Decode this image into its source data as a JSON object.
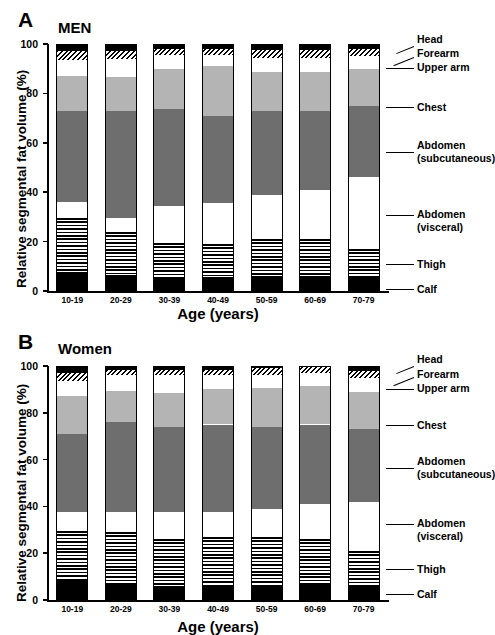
{
  "figure": {
    "panels": [
      {
        "letter": "A",
        "title": "MEN",
        "yaxis_label": "Relative segmental fat volume (%)",
        "xaxis_label": "Age (years)",
        "yticks": [
          0,
          20,
          40,
          60,
          80,
          100
        ],
        "categories": [
          "10-19",
          "20-29",
          "30-39",
          "40-49",
          "50-59",
          "60-69",
          "70-79"
        ]
      },
      {
        "letter": "B",
        "title": "Women",
        "yaxis_label": "Relative segmental fat volume (%)",
        "xaxis_label": "Age (years)",
        "yticks": [
          0,
          20,
          40,
          60,
          80,
          100
        ],
        "categories": [
          "10-19",
          "20-29",
          "30-39",
          "40-49",
          "50-59",
          "60-69",
          "70-79"
        ]
      }
    ],
    "legend": [
      {
        "key": "head",
        "label": "Head"
      },
      {
        "key": "forearm",
        "label": "Forearm"
      },
      {
        "key": "upper_arm",
        "label": "Upper arm"
      },
      {
        "key": "chest",
        "label": "Chest"
      },
      {
        "key": "abd_sub",
        "label": "Abdomen"
      },
      {
        "key": "abd_sub2",
        "label": "(subcutaneous)"
      },
      {
        "key": "abd_vis",
        "label": "Abdomen"
      },
      {
        "key": "abd_vis2",
        "label": "(visceral)"
      },
      {
        "key": "thigh",
        "label": "Thigh"
      },
      {
        "key": "calf",
        "label": "Calf"
      }
    ]
  },
  "chart_data": [
    {
      "type": "bar",
      "stacked": true,
      "title": "MEN",
      "panel": "A",
      "xlabel": "Age (years)",
      "ylabel": "Relative segmental fat volume (%)",
      "ylim": [
        0,
        100
      ],
      "yticks": [
        0,
        20,
        40,
        60,
        80,
        100
      ],
      "grid": false,
      "legend_position": "right",
      "categories": [
        "10-19",
        "20-29",
        "30-39",
        "40-49",
        "50-59",
        "60-69",
        "70-79"
      ],
      "series": [
        {
          "name": "Calf",
          "fill": "black",
          "values": [
            7.0,
            6.5,
            5.0,
            5.5,
            5.5,
            5.5,
            6.0
          ]
        },
        {
          "name": "Thigh",
          "fill": "horizontal-stripe",
          "values": [
            22.5,
            17.5,
            14.5,
            13.5,
            15.5,
            15.5,
            11.0
          ]
        },
        {
          "name": "Abdomen (visceral)",
          "fill": "white",
          "values": [
            6.5,
            5.5,
            15.0,
            16.5,
            18.0,
            20.0,
            29.0
          ]
        },
        {
          "name": "Abdomen (subcutaneous)",
          "fill": "dark-gray",
          "values": [
            37.0,
            43.5,
            39.0,
            35.5,
            34.0,
            32.0,
            29.0
          ]
        },
        {
          "name": "Chest",
          "fill": "light-gray",
          "values": [
            14.0,
            13.5,
            16.5,
            20.0,
            15.5,
            15.5,
            15.0
          ]
        },
        {
          "name": "Upper arm",
          "fill": "white",
          "values": [
            6.5,
            7.5,
            5.5,
            4.5,
            6.0,
            6.0,
            5.0
          ]
        },
        {
          "name": "Forearm",
          "fill": "diagonal-hatch",
          "values": [
            3.5,
            3.0,
            2.5,
            2.5,
            3.0,
            3.0,
            3.0
          ]
        },
        {
          "name": "Head",
          "fill": "black",
          "values": [
            3.0,
            3.0,
            2.0,
            2.0,
            2.5,
            2.5,
            2.0
          ]
        }
      ]
    },
    {
      "type": "bar",
      "stacked": true,
      "title": "Women",
      "panel": "B",
      "xlabel": "Age (years)",
      "ylabel": "Relative segmental fat volume (%)",
      "ylim": [
        0,
        100
      ],
      "yticks": [
        0,
        20,
        40,
        60,
        80,
        100
      ],
      "grid": false,
      "legend_position": "right",
      "categories": [
        "10-19",
        "20-29",
        "30-39",
        "40-49",
        "50-59",
        "60-69",
        "70-79"
      ],
      "series": [
        {
          "name": "Calf",
          "fill": "black",
          "values": [
            8.5,
            6.5,
            6.0,
            6.0,
            6.0,
            6.5,
            5.5
          ]
        },
        {
          "name": "Thigh",
          "fill": "horizontal-stripe",
          "values": [
            21.0,
            22.5,
            20.0,
            21.0,
            21.0,
            19.5,
            15.5
          ]
        },
        {
          "name": "Abdomen (visceral)",
          "fill": "white",
          "values": [
            8.0,
            8.5,
            11.5,
            10.5,
            12.0,
            15.0,
            21.0
          ]
        },
        {
          "name": "Abdomen (subcutaneous)",
          "fill": "dark-gray",
          "values": [
            33.5,
            38.5,
            36.5,
            37.5,
            35.0,
            34.0,
            31.0
          ]
        },
        {
          "name": "Chest",
          "fill": "light-gray",
          "values": [
            16.0,
            13.5,
            14.5,
            15.0,
            16.5,
            16.5,
            16.0
          ]
        },
        {
          "name": "Upper arm",
          "fill": "white",
          "values": [
            6.5,
            6.5,
            7.5,
            6.0,
            5.5,
            5.5,
            6.0
          ]
        },
        {
          "name": "Forearm",
          "fill": "diagonal-hatch",
          "values": [
            3.5,
            2.5,
            2.5,
            2.5,
            3.0,
            3.0,
            3.0
          ]
        },
        {
          "name": "Head",
          "fill": "black",
          "values": [
            3.0,
            1.5,
            1.5,
            1.5,
            1.0,
            0.0,
            2.0
          ]
        }
      ]
    }
  ],
  "colors": {
    "black": "#000000",
    "dark_gray": "#6e6e6e",
    "light_gray": "#b4b4b4",
    "white": "#ffffff"
  }
}
